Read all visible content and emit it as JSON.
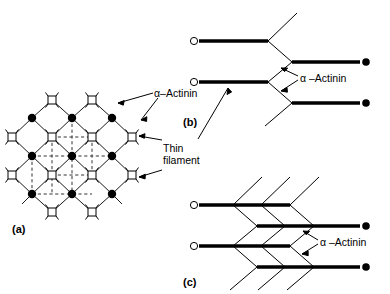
{
  "figure": {
    "title_text": "",
    "panels": [
      {
        "id": "a",
        "label": "(a)"
      },
      {
        "id": "b",
        "label": "(b)"
      },
      {
        "id": "c",
        "label": "(c)"
      }
    ],
    "annotations": {
      "alpha_actinin_a": "α–Actinin",
      "alpha_actinin_b": "α –Actinin",
      "alpha_actinin_c": "α –Actinin",
      "thin_filament_line1": "Thin",
      "thin_filament_line2": "filament"
    },
    "legend_semantics": {
      "open_square": "thin-filament-cross-section",
      "filled_circle": "alpha-actinin-crosslink",
      "open_circle": "thin-filament-free-end",
      "thick_bar": "thin-filament",
      "thin_diagonal": "alpha-actinin-crosslink-strand",
      "dashed_line": "unit-cell-grid"
    },
    "colors": {
      "ink": "#000000",
      "background": "#ffffff",
      "lattice_line": "#1a1a1a",
      "dashed_line": "#333333"
    },
    "panel_a": {
      "node_rows": [
        {
          "y": 100,
          "type": "open-square",
          "xs": [
            52,
            92
          ]
        },
        {
          "y": 118,
          "type": "filled-circle",
          "xs": [
            32,
            72,
            112
          ]
        },
        {
          "y": 137,
          "type": "open-square",
          "xs": [
            12,
            52,
            92,
            132
          ]
        },
        {
          "y": 156,
          "type": "filled-circle",
          "xs": [
            32,
            72,
            112
          ]
        },
        {
          "y": 175,
          "type": "open-square",
          "xs": [
            12,
            52,
            92,
            132
          ]
        },
        {
          "y": 194,
          "type": "filled-circle",
          "xs": [
            32,
            72,
            112
          ]
        },
        {
          "y": 212,
          "type": "open-square",
          "xs": [
            52,
            92
          ]
        }
      ]
    },
    "panel_b": {
      "left_filaments": 2,
      "right_filaments": 2,
      "crossover_columns": 1
    },
    "panel_c": {
      "left_filaments": 2,
      "right_filaments": 2,
      "crossover_columns": 3
    }
  }
}
